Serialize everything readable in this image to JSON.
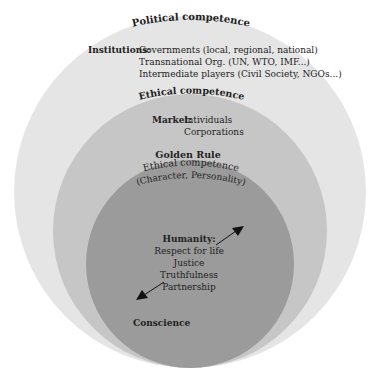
{
  "diagram": {
    "type": "concentric-circles",
    "colors": {
      "outer_circle": "#e5e5e5",
      "middle_circle": "#c6c6c6",
      "inner_circle": "#9b9b9b",
      "text": "#222222",
      "arrow": "#111111"
    },
    "outer": {
      "title": "Political competence",
      "label": "Institutions:",
      "items": [
        "Governments (local, regional, national)",
        "Transnational Org. (UN, WTO, IMF...)",
        "Intermediate players (Civil Society, NGOs...)"
      ]
    },
    "middle": {
      "title": "Ethical competence",
      "label": "Market:",
      "items": [
        "Intividuals",
        "Corporations"
      ]
    },
    "inner": {
      "top_label": "Golden Rule",
      "title": "Ethical competence",
      "subtitle": "(Character, Personality)",
      "heading": "Humanity:",
      "items": [
        "Respect for life",
        "Justice",
        "Truthfulness",
        "Partnership"
      ],
      "bottom_label": "Conscience"
    }
  }
}
